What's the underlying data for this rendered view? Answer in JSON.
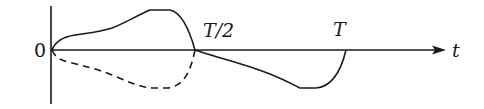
{
  "diagram": {
    "type": "waveform-sketch",
    "labels": {
      "origin": "0",
      "half_period": "T/2",
      "period": "T",
      "time_axis": "t"
    },
    "colors": {
      "line": "#1a1a1a",
      "background": "#ffffff"
    },
    "axes": {
      "horizontal": {
        "label": "t",
        "arrow": true
      },
      "vertical": {
        "label": "",
        "arrow": false
      }
    },
    "curves": [
      {
        "name": "solid-positive-half",
        "style": "solid",
        "segment": "0 to T/2",
        "direction": "above axis"
      },
      {
        "name": "dashed-mirror-half",
        "style": "dashed",
        "segment": "0 to T/2",
        "direction": "below axis"
      },
      {
        "name": "solid-negative-half",
        "style": "solid",
        "segment": "T/2 to T",
        "direction": "below axis"
      }
    ]
  }
}
